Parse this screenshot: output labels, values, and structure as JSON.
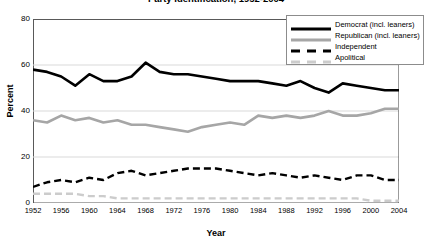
{
  "figure": {
    "title": "Party Identification, 1952-2004",
    "title_visible": false
  },
  "chart_data": {
    "type": "line",
    "title": "Party Identification, 1952-2004",
    "xlabel": "Year",
    "ylabel": "Percent",
    "xlim": [
      1952,
      2004
    ],
    "ylim": [
      0,
      80
    ],
    "ytick_labels": [
      "0",
      "20",
      "40",
      "60",
      "80"
    ],
    "yticks": [
      0,
      20,
      40,
      60,
      80
    ],
    "xtick_labels": [
      "1952",
      "1956",
      "1960",
      "1964",
      "1968",
      "1972",
      "1976",
      "1980",
      "1984",
      "1988",
      "1992",
      "1996",
      "2000",
      "2004"
    ],
    "xticks": [
      1952,
      1956,
      1960,
      1964,
      1968,
      1972,
      1976,
      1980,
      1984,
      1988,
      1992,
      1996,
      2000,
      2004
    ],
    "grid": "horizontal",
    "legend_position": "upper-right",
    "x": [
      1952,
      1954,
      1956,
      1958,
      1960,
      1962,
      1964,
      1966,
      1968,
      1970,
      1972,
      1974,
      1976,
      1978,
      1980,
      1982,
      1984,
      1986,
      1988,
      1990,
      1992,
      1994,
      1996,
      1998,
      2000,
      2002,
      2004
    ],
    "series": [
      {
        "name": "Democrat (incl. leaners)",
        "color": "#000000",
        "style": "solid",
        "width": 2.6,
        "values": [
          58,
          57,
          55,
          51,
          56,
          53,
          53,
          55,
          61,
          57,
          56,
          56,
          55,
          54,
          53,
          53,
          53,
          52,
          51,
          53,
          50,
          48,
          52,
          51,
          50,
          49,
          49
        ]
      },
      {
        "name": "Republican (incl. leaners)",
        "color": "#a6a6a6",
        "style": "solid",
        "width": 2.6,
        "values": [
          36,
          35,
          38,
          36,
          37,
          35,
          36,
          34,
          34,
          33,
          32,
          31,
          33,
          34,
          35,
          34,
          38,
          37,
          38,
          37,
          38,
          40,
          38,
          38,
          39,
          41,
          41
        ]
      },
      {
        "name": "Independent",
        "color": "#000000",
        "style": "dashed",
        "width": 2.4,
        "values": [
          7,
          9,
          10,
          9,
          11,
          10,
          13,
          14,
          12,
          13,
          14,
          15,
          15,
          15,
          14,
          13,
          12,
          13,
          12,
          11,
          12,
          11,
          10,
          12,
          12,
          10,
          10
        ]
      },
      {
        "name": "Apolitical",
        "color": "#cccccc",
        "style": "dashed",
        "width": 2.4,
        "values": [
          4,
          4,
          4,
          4,
          3,
          3,
          2,
          2,
          2,
          2,
          2,
          2,
          2,
          2,
          2,
          2,
          2,
          2,
          2,
          2,
          2,
          2,
          2,
          2,
          1,
          1,
          1
        ]
      }
    ]
  },
  "legend": {
    "items": [
      {
        "label": "Democrat (incl. leaners)"
      },
      {
        "label": "Republican (incl. leaners)"
      },
      {
        "label": "Independent"
      },
      {
        "label": "Apolitical"
      }
    ]
  }
}
